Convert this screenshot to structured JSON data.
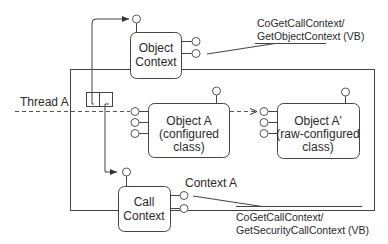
{
  "diagram": {
    "context_a": {
      "label": "Context A"
    },
    "thread": {
      "label": "Thread A"
    },
    "object_context": {
      "line1": "Object",
      "line2": "Context"
    },
    "call_context": {
      "line1": "Call",
      "line2": "Context"
    },
    "object_a": {
      "line1": "Object A",
      "line2": "(configured",
      "line3": "class)"
    },
    "object_a_prime": {
      "line1": "Object A'",
      "line2": "(raw-configured",
      "line3": "class)"
    },
    "callout_top": {
      "line1": "CoGetCallContext/",
      "line2": "GetObjectContext (VB)"
    },
    "callout_bottom": {
      "line1": "CoGetCallContext/",
      "line2": "GetSecurityCallContext (VB)"
    }
  },
  "colors": {
    "stroke": "#444444",
    "text": "#2a2a2a",
    "background": "#ffffff"
  }
}
